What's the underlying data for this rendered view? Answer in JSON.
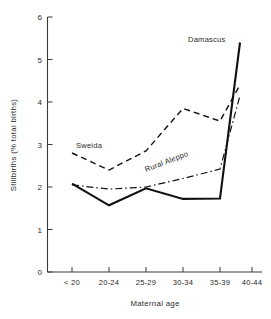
{
  "chart_data": {
    "type": "line",
    "title": "",
    "xlabel": "Maternal age",
    "ylabel": "Stillbirths (% total births)",
    "categories": [
      "< 20",
      "20-24",
      "25-29",
      "30-34",
      "35-39",
      "40-44"
    ],
    "ylim": [
      0,
      6
    ],
    "yticks": [
      "0",
      "1",
      "2",
      "3",
      "4",
      "5",
      "6"
    ],
    "grid": false,
    "legend_position": "inline-annotations",
    "series": [
      {
        "name": "Damascus",
        "style": "solid",
        "values": [
          2.08,
          1.57,
          1.97,
          1.72,
          1.73,
          5.4
        ]
      },
      {
        "name": "Sweida",
        "style": "dashed",
        "values": [
          2.8,
          2.4,
          2.85,
          3.85,
          3.55,
          4.4
        ]
      },
      {
        "name": "Rural Aleppo",
        "style": "dash-dot",
        "values": [
          2.05,
          1.95,
          2.0,
          2.2,
          2.42,
          4.15
        ]
      }
    ],
    "annotations": [
      {
        "text": "Damascus",
        "series": "Damascus"
      },
      {
        "text": "Sweida",
        "series": "Sweida"
      },
      {
        "text": "Rural Aleppo",
        "series": "Rural Aleppo"
      }
    ]
  },
  "axes": {
    "y_tick_0": "0",
    "y_tick_1": "1",
    "y_tick_2": "2",
    "y_tick_3": "3",
    "y_tick_4": "4",
    "y_tick_5": "5",
    "y_tick_6": "6",
    "x_tick_0": "< 20",
    "x_tick_1": "20-24",
    "x_tick_2": "25-29",
    "x_tick_3": "30-34",
    "x_tick_4": "35-39",
    "x_tick_5": "40-44",
    "x_title": "Maternal age",
    "y_title": "Stillbirths (% total births)"
  },
  "labels": {
    "damascus": "Damascus",
    "sweida": "Sweida",
    "rural_aleppo": "Rural Aleppo"
  },
  "colors": {
    "ink": "#111111",
    "axis": "#3a3a3a",
    "background": "#ffffff"
  }
}
